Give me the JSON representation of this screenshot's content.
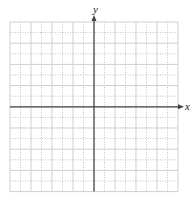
{
  "diagram": {
    "type": "coordinate-grid",
    "x_axis_label": "x",
    "y_axis_label": "y",
    "grid": {
      "columns": 16,
      "rows": 16,
      "left": 10,
      "top": 22,
      "cell_w": 10.5,
      "cell_h": 10.6,
      "origin_col": 8,
      "origin_row": 8
    },
    "colors": {
      "grid_major": "#cfcfcf",
      "grid_minor": "#b5b5b5",
      "axis": "#444444"
    }
  }
}
